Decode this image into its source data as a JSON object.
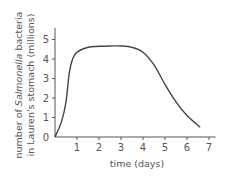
{
  "chart_data": {
    "type": "line",
    "title": "",
    "xlabel": "time (days)",
    "ylabel_line1_prefix": "number of ",
    "ylabel_line1_italic": "Salmonella",
    "ylabel_line1_suffix": " bacteria",
    "ylabel_line2": "in Lauren's stomach (millions)",
    "xlim": [
      0,
      7.3
    ],
    "ylim": [
      0,
      5.6
    ],
    "x_ticks": [
      1,
      2,
      3,
      4,
      5,
      6,
      7
    ],
    "y_ticks": [
      0,
      1,
      2,
      3,
      4,
      5
    ],
    "grid": false,
    "legend": null,
    "series": [
      {
        "name": "Salmonella bacteria",
        "color": "#444444",
        "x": [
          0,
          0.3,
          0.5,
          0.65,
          0.8,
          1.0,
          1.5,
          2.0,
          2.5,
          3.0,
          3.5,
          4.0,
          4.5,
          5.0,
          5.5,
          6.0,
          6.6
        ],
        "y": [
          0,
          0.8,
          1.8,
          3.3,
          4.0,
          4.35,
          4.6,
          4.65,
          4.67,
          4.67,
          4.6,
          4.35,
          3.7,
          2.7,
          1.8,
          1.1,
          0.5
        ]
      }
    ]
  },
  "colors": {
    "axis": "#555555",
    "line": "#444444",
    "text": "#555555"
  }
}
